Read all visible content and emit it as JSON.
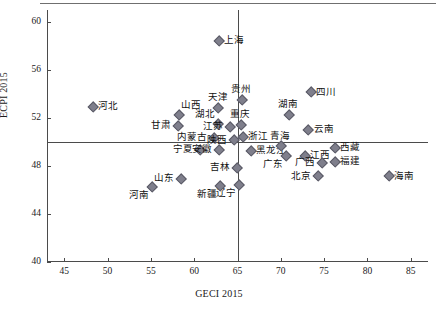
{
  "chart_data": {
    "type": "scatter",
    "title": "",
    "xlabel": "GECI 2015",
    "ylabel": "ECPI 2015",
    "xlim": [
      43,
      87
    ],
    "ylim": [
      40,
      61
    ],
    "xticks": [
      45,
      50,
      55,
      60,
      65,
      70,
      75,
      80,
      85
    ],
    "yticks": [
      40,
      44,
      48,
      52,
      56,
      60
    ],
    "grid": false,
    "legend": "none",
    "crosshair_axes": {
      "x": 65.0,
      "y": 50.0
    },
    "marker_color": "#7f7f8c",
    "marker_shape": "diamond",
    "points": [
      {
        "label": "上海",
        "x": 62.8,
        "y": 58.5,
        "pos": "lab-r"
      },
      {
        "label": "河北",
        "x": 48.2,
        "y": 53.0,
        "pos": "lab-r"
      },
      {
        "label": "山西",
        "x": 58.2,
        "y": 52.3,
        "pos": "lab-tr"
      },
      {
        "label": "天津",
        "x": 62.7,
        "y": 52.9,
        "pos": "lab-t"
      },
      {
        "label": "贵州",
        "x": 65.4,
        "y": 53.6,
        "pos": "lab-t"
      },
      {
        "label": "甘肃",
        "x": 58.0,
        "y": 51.4,
        "pos": "lab-l"
      },
      {
        "label": "湖北",
        "x": 62.6,
        "y": 51.6,
        "pos": "lab-tl"
      },
      {
        "label": "江苏",
        "x": 64.0,
        "y": 51.3,
        "pos": "lab-l"
      },
      {
        "label": "重庆",
        "x": 65.3,
        "y": 51.5,
        "pos": "lab-t"
      },
      {
        "label": "内蒙古",
        "x": 62.2,
        "y": 50.4,
        "pos": "lab-l"
      },
      {
        "label": "陕西",
        "x": 64.5,
        "y": 50.2,
        "pos": "lab-l"
      },
      {
        "label": "浙江",
        "x": 65.5,
        "y": 50.5,
        "pos": "lab-r"
      },
      {
        "label": "宁夏",
        "x": 60.6,
        "y": 49.4,
        "pos": "lab-l"
      },
      {
        "label": "安徽",
        "x": 62.8,
        "y": 49.4,
        "pos": "lab-l"
      },
      {
        "label": "四川",
        "x": 73.4,
        "y": 54.2,
        "pos": "lab-r"
      },
      {
        "label": "湖南",
        "x": 70.8,
        "y": 52.3,
        "pos": "lab-t"
      },
      {
        "label": "云南",
        "x": 73.1,
        "y": 51.1,
        "pos": "lab-r"
      },
      {
        "label": "黑龙江",
        "x": 66.5,
        "y": 49.3,
        "pos": "lab-r"
      },
      {
        "label": "青海",
        "x": 69.9,
        "y": 49.7,
        "pos": "lab-t"
      },
      {
        "label": "西藏",
        "x": 76.2,
        "y": 49.6,
        "pos": "lab-r"
      },
      {
        "label": "吉林",
        "x": 64.8,
        "y": 47.9,
        "pos": "lab-l"
      },
      {
        "label": "广东",
        "x": 70.5,
        "y": 48.9,
        "pos": "lab-bl"
      },
      {
        "label": "江西",
        "x": 72.7,
        "y": 48.9,
        "pos": "lab-r"
      },
      {
        "label": "广西",
        "x": 74.7,
        "y": 48.3,
        "pos": "lab-l"
      },
      {
        "label": "福建",
        "x": 76.2,
        "y": 48.4,
        "pos": "lab-r"
      },
      {
        "label": "北京",
        "x": 74.2,
        "y": 47.2,
        "pos": "lab-l"
      },
      {
        "label": "海南",
        "x": 82.4,
        "y": 47.2,
        "pos": "lab-r"
      },
      {
        "label": "辽宁",
        "x": 65.1,
        "y": 46.5,
        "pos": "lab-bl"
      },
      {
        "label": "山东",
        "x": 58.4,
        "y": 47.0,
        "pos": "lab-l"
      },
      {
        "label": "河南",
        "x": 55.0,
        "y": 46.3,
        "pos": "lab-bl"
      },
      {
        "label": "新疆",
        "x": 62.9,
        "y": 46.4,
        "pos": "lab-bl"
      }
    ]
  }
}
